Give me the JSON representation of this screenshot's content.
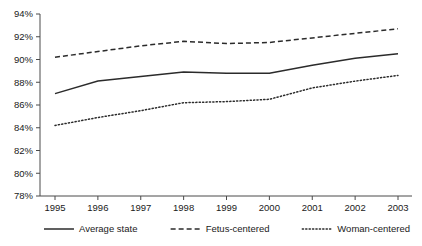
{
  "chart_data": {
    "type": "line",
    "title": "",
    "subtitle": "",
    "xlabel": "",
    "ylabel": "",
    "categories": [
      "1995",
      "1996",
      "1997",
      "1998",
      "1999",
      "2000",
      "2001",
      "2002",
      "2003"
    ],
    "x": [
      1995,
      1996,
      1997,
      1998,
      1999,
      2000,
      2001,
      2002,
      2003
    ],
    "xlim": [
      1995,
      2003
    ],
    "ylim": [
      78,
      94
    ],
    "ytick_values": [
      78,
      80,
      82,
      84,
      86,
      88,
      90,
      92,
      94
    ],
    "ytick_labels": [
      "78%",
      "80%",
      "82%",
      "84%",
      "86%",
      "88%",
      "90%",
      "92%",
      "94%"
    ],
    "grid": false,
    "legend_position": "bottom",
    "series": [
      {
        "name": "Average state",
        "style": "solid",
        "color": "#2b2b2b",
        "values": [
          87.0,
          88.1,
          88.5,
          88.9,
          88.8,
          88.8,
          89.5,
          90.1,
          90.5
        ]
      },
      {
        "name": "Fetus-centered",
        "style": "dashed",
        "color": "#2b2b2b",
        "values": [
          90.2,
          90.7,
          91.2,
          91.6,
          91.4,
          91.5,
          91.9,
          92.3,
          92.7
        ]
      },
      {
        "name": "Woman-centered",
        "style": "dotted",
        "color": "#2b2b2b",
        "values": [
          84.2,
          84.9,
          85.5,
          86.2,
          86.3,
          86.5,
          87.5,
          88.1,
          88.6
        ]
      }
    ]
  },
  "legend": {
    "items": [
      {
        "label": "Average state",
        "style": "solid"
      },
      {
        "label": "Fetus-centered",
        "style": "dashed"
      },
      {
        "label": "Woman-centered",
        "style": "dotted"
      }
    ]
  },
  "axes": {
    "y_labels": [
      "94%",
      "92%",
      "90%",
      "88%",
      "86%",
      "84%",
      "82%",
      "80%",
      "78%"
    ],
    "x_labels": [
      "1995",
      "1996",
      "1997",
      "1998",
      "1999",
      "2000",
      "2001",
      "2002",
      "2003"
    ]
  }
}
